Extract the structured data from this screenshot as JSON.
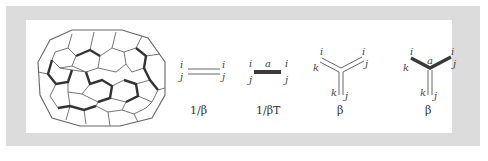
{
  "figure": {
    "lattice": {
      "description": "honeycomb lattice with thick-bond loops"
    },
    "diagrams": [
      {
        "id": "propagator-free",
        "index_top_left": "i",
        "index_bottom_left": "j",
        "index_top_right": "i",
        "index_bottom_right": "j",
        "caption": "1/β"
      },
      {
        "id": "propagator-gauge",
        "index_top_left": "i",
        "index_bottom_left": "j",
        "index_top_right": "i",
        "index_bottom_right": "j",
        "mid_label": "a",
        "caption": "1/βT"
      },
      {
        "id": "vertex-free",
        "labels": {
          "top_left_i": "i",
          "top_left_k": "k",
          "top_right_i": "i",
          "top_right_j": "j",
          "bottom_k": "k",
          "bottom_j": "j"
        },
        "caption": "β"
      },
      {
        "id": "vertex-gauge",
        "labels": {
          "top_left_i": "i",
          "top_left_k": "k",
          "top_right_i": "i",
          "top_right_j": "j",
          "bottom_k": "k",
          "bottom_j": "j"
        },
        "mid_label": "a",
        "caption": "β"
      }
    ],
    "colors": {
      "frame": "#dcdcdc",
      "line": "#555555",
      "thick": "#3a3a3a"
    }
  }
}
